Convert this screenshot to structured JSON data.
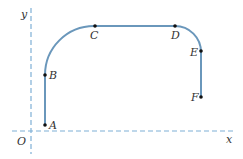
{
  "diagram": {
    "axes": {
      "x_label": "x",
      "y_label": "y",
      "origin_label": "O",
      "axis_color": "#7fb0d6"
    },
    "path_color": "#6a97bb",
    "point_color": "#111111",
    "points": [
      {
        "name": "A",
        "label": "A"
      },
      {
        "name": "B",
        "label": "B"
      },
      {
        "name": "C",
        "label": "C"
      },
      {
        "name": "D",
        "label": "D"
      },
      {
        "name": "E",
        "label": "E"
      },
      {
        "name": "F",
        "label": "F"
      }
    ]
  }
}
